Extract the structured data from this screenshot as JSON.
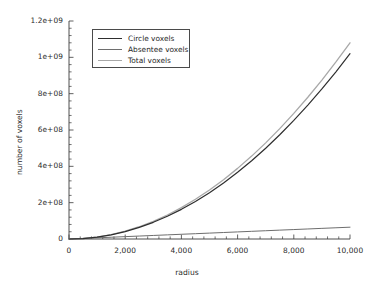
{
  "chart_data": {
    "type": "line",
    "title": "",
    "xlabel": "radius",
    "ylabel": "number of voxels",
    "xlim": [
      0,
      10000
    ],
    "ylim": [
      0,
      1200000000
    ],
    "grid": false,
    "legend_position": "upper-left-inside",
    "x_tick_labels": [
      "0",
      "2,000",
      "4,000",
      "6,000",
      "8,000",
      "10,000"
    ],
    "x_ticks": [
      0,
      2000,
      4000,
      6000,
      8000,
      10000
    ],
    "x_minor_ticks_per_interval": 4,
    "y_tick_labels": [
      "0",
      "2e+08",
      "4e+08",
      "6e+08",
      "8e+08",
      "1e+09",
      "1.2e+09"
    ],
    "y_ticks": [
      0,
      200000000,
      400000000,
      600000000,
      800000000,
      1000000000,
      1200000000
    ],
    "y_minor_ticks_per_interval": 4,
    "x": [
      0,
      500,
      1000,
      1500,
      2000,
      2500,
      3000,
      3500,
      4000,
      4500,
      5000,
      5500,
      6000,
      6500,
      7000,
      7500,
      8000,
      8500,
      9000,
      9500,
      10000
    ],
    "series": [
      {
        "name": "Circle voxels",
        "color": "#2e2e2e",
        "width": 1.2,
        "values": [
          0,
          2550000,
          10200000,
          22950000,
          40800000,
          63750000,
          91800000,
          124950000,
          163200000,
          206550000,
          255000000,
          308550000,
          367200000,
          430950000,
          499800000,
          573750000,
          652800000,
          736950000,
          826200000,
          920550000,
          1020000000
        ]
      },
      {
        "name": "Absentee voxels",
        "color": "#6e6e6e",
        "width": 1.0,
        "values": [
          0,
          3250000,
          6500000,
          9750000,
          13000000,
          16250000,
          19500000,
          22750000,
          26000000,
          29250000,
          32500000,
          35750000,
          39000000,
          42250000,
          45500000,
          48750000,
          52000000,
          55250000,
          58500000,
          61750000,
          65000000
        ]
      },
      {
        "name": "Total voxels",
        "color": "#a8a8a8",
        "width": 1.3,
        "values": [
          0,
          2700000,
          10800000,
          24300000,
          43200000,
          67500000,
          97200000,
          132300000,
          172800000,
          218700000,
          270000000,
          326700000,
          388800000,
          456300000,
          529200000,
          607500000,
          691200000,
          780300000,
          874800000,
          974700000,
          1080000000
        ]
      }
    ]
  },
  "legend": {
    "entries": [
      {
        "label": "Circle voxels"
      },
      {
        "label": "Absentee voxels"
      },
      {
        "label": "Total voxels"
      }
    ]
  }
}
